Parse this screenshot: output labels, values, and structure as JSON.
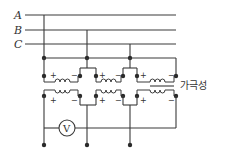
{
  "diagram": {
    "type": "three-phase transformer polarity test circuit",
    "lines": [
      {
        "label": "A",
        "y": 15
      },
      {
        "label": "B",
        "y": 30
      },
      {
        "label": "C",
        "y": 44
      }
    ],
    "plus_sign": "+",
    "minus_sign": "−",
    "voltmeter_label": "V",
    "polarity_label": "가극성",
    "colors": {
      "line": "#3a3a3a",
      "background": "#ffffff"
    }
  }
}
